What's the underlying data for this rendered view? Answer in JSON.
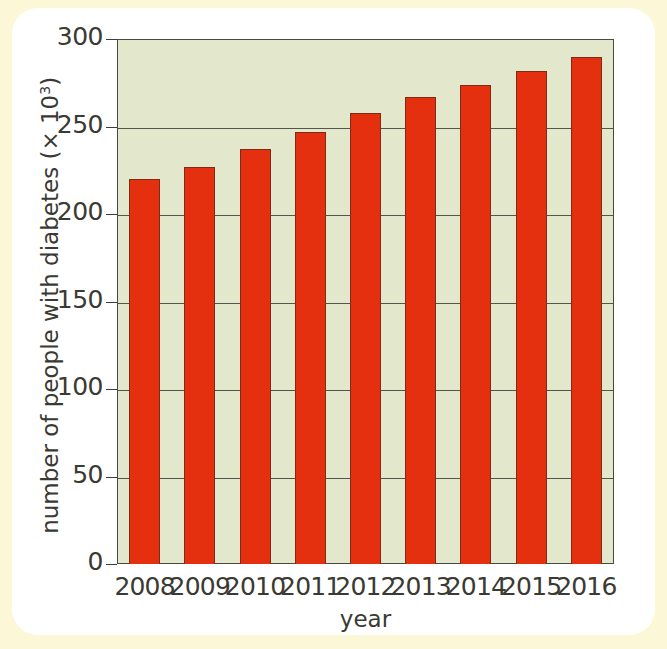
{
  "figure": {
    "card_background": "#ffffff",
    "page_background": "#fcf8d7"
  },
  "chart_data": {
    "type": "bar",
    "title": "",
    "xlabel": "year",
    "ylabel": "number of people with diabetes (× 10³)",
    "ylabel_base": "number of people with diabetes (× 10",
    "ylabel_exponent": "3",
    "ylabel_close": ")",
    "categories": [
      "2008",
      "2009",
      "2010",
      "2011",
      "2012",
      "2013",
      "2014",
      "2015",
      "2016"
    ],
    "values": [
      220,
      227,
      237,
      247,
      258,
      267,
      274,
      282,
      290
    ],
    "ylim": [
      0,
      300
    ],
    "ytick_values": [
      0,
      50,
      100,
      150,
      200,
      250,
      300
    ],
    "ytick_labels": [
      "0",
      "50",
      "100",
      "150",
      "200",
      "250",
      "300"
    ],
    "grid": true,
    "grid_axis": "y",
    "legend": "none",
    "bar_color": "#e4300f",
    "bar_edge_color": "#7d2a16",
    "plot_background": "#e3e8cd",
    "axis_color": "#4a4a42"
  }
}
